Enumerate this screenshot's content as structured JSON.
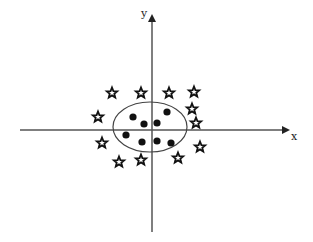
{
  "diagram": {
    "type": "scatter-classification",
    "axes": {
      "x_label": "x",
      "y_label": "y",
      "origin": [
        152,
        130
      ],
      "x_axis": {
        "from": 20,
        "to": 288,
        "y": 130
      },
      "y_axis": {
        "x": 152,
        "from": 232,
        "to": 16
      }
    },
    "boundary": {
      "shape": "ellipse",
      "cx": 150,
      "cy": 127,
      "rx": 37,
      "ry": 25,
      "color": "#444444"
    },
    "classes": [
      {
        "name": "inner-class",
        "marker": "filled-circle",
        "color": "#111111",
        "points": [
          [
            133,
            117
          ],
          [
            144,
            124
          ],
          [
            157,
            123
          ],
          [
            167,
            112
          ],
          [
            126,
            135
          ],
          [
            142,
            142
          ],
          [
            157,
            141
          ],
          [
            171,
            143
          ]
        ]
      },
      {
        "name": "outer-class",
        "marker": "star",
        "color": "#111111",
        "points": [
          [
            112,
            93
          ],
          [
            141,
            93
          ],
          [
            169,
            93
          ],
          [
            194,
            92
          ],
          [
            98,
            117
          ],
          [
            192,
            109
          ],
          [
            196,
            123
          ],
          [
            102,
            143
          ],
          [
            200,
            147
          ],
          [
            119,
            162
          ],
          [
            141,
            160
          ],
          [
            178,
            158
          ]
        ]
      }
    ],
    "colors": {
      "axis": "#555555",
      "marker": "#111111",
      "background": "#ffffff"
    }
  }
}
